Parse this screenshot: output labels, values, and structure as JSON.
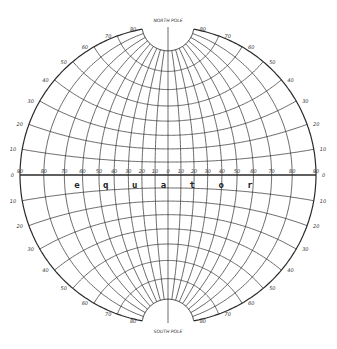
{
  "diagram": {
    "type": "stereographic equatorial globe grid",
    "center": [
      168,
      175
    ],
    "radius": 148,
    "line_color": "#2a2a2a",
    "background": "#ffffff",
    "meridian_step_deg": 10,
    "parallel_step_deg": 10,
    "pole_cap_latitude": 80,
    "north_pole_label": "NORTH POLE",
    "south_pole_label": "SOUTH POLE",
    "equator_label": "equator",
    "equator_longitude_labels": [
      "90",
      "80",
      "70",
      "60",
      "50",
      "40",
      "30",
      "20",
      "10",
      "0",
      "10",
      "20",
      "30",
      "40",
      "50",
      "60",
      "70",
      "80",
      "90"
    ],
    "left_edge_latitude_labels": [
      "80",
      "70",
      "60",
      "50",
      "40",
      "30",
      "20",
      "10",
      "0",
      "10",
      "20",
      "30",
      "40",
      "50",
      "60",
      "70",
      "80"
    ],
    "right_edge_latitude_labels": [
      "80",
      "70",
      "60",
      "50",
      "40",
      "30",
      "20",
      "10",
      "0",
      "10",
      "20",
      "30",
      "40",
      "50",
      "60",
      "70",
      "80"
    ],
    "latitudes": [
      10,
      20,
      30,
      40,
      50,
      60,
      70,
      80
    ],
    "longitudes": [
      -90,
      -80,
      -70,
      -60,
      -50,
      -40,
      -30,
      -20,
      -10,
      0,
      10,
      20,
      30,
      40,
      50,
      60,
      70,
      80,
      90
    ]
  }
}
